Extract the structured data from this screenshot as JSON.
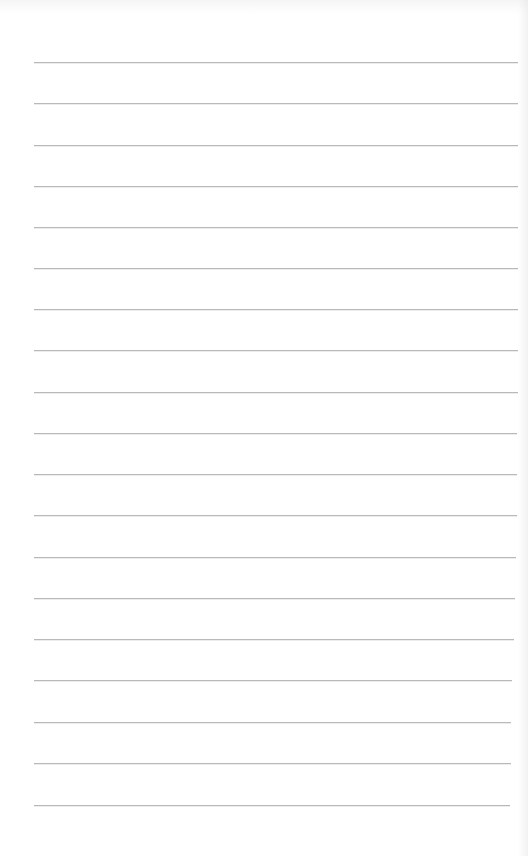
{
  "page": {
    "type": "ruled-notebook-page",
    "background_color": "#ffffff",
    "rule_color": "#b9b9b9",
    "rule_left_x": 34,
    "rules": [
      {
        "y": 62,
        "right_x": 518
      },
      {
        "y": 103,
        "right_x": 518
      },
      {
        "y": 145,
        "right_x": 518
      },
      {
        "y": 186,
        "right_x": 518
      },
      {
        "y": 227,
        "right_x": 518
      },
      {
        "y": 268,
        "right_x": 518
      },
      {
        "y": 309,
        "right_x": 518
      },
      {
        "y": 350,
        "right_x": 518
      },
      {
        "y": 392,
        "right_x": 518
      },
      {
        "y": 433,
        "right_x": 517
      },
      {
        "y": 474,
        "right_x": 517
      },
      {
        "y": 515,
        "right_x": 517
      },
      {
        "y": 557,
        "right_x": 516
      },
      {
        "y": 598,
        "right_x": 515
      },
      {
        "y": 639,
        "right_x": 514
      },
      {
        "y": 680,
        "right_x": 512
      },
      {
        "y": 722,
        "right_x": 511
      },
      {
        "y": 763,
        "right_x": 511
      },
      {
        "y": 805,
        "right_x": 510
      }
    ]
  }
}
